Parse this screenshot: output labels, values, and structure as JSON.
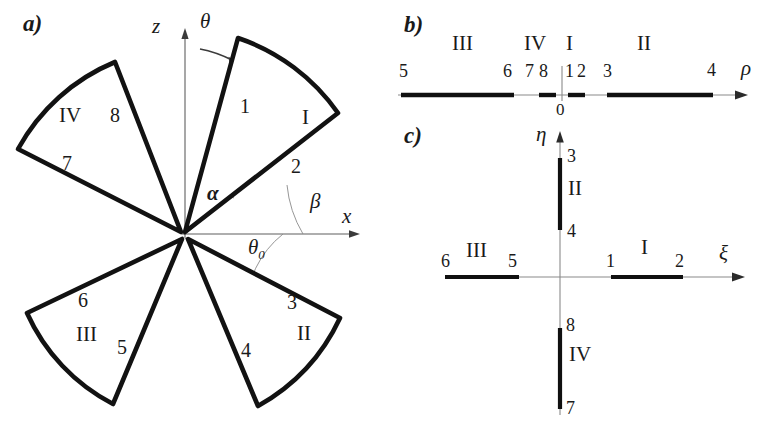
{
  "figure": {
    "kind": "diagram",
    "panels": [
      {
        "tag": "a)",
        "name": "physical-plane"
      },
      {
        "tag": "b)",
        "name": "rho-plane"
      },
      {
        "tag": "c)",
        "name": "xi-eta-plane"
      }
    ]
  },
  "panel_a": {
    "tag": "a)",
    "axes": {
      "vertical_label": "z",
      "horizontal_label": "x",
      "rotation_label": "θ",
      "rotation_icon": "curved-arrow-icon"
    },
    "angles": [
      {
        "name": "alpha",
        "symbol": "α"
      },
      {
        "name": "beta",
        "symbol": "β"
      },
      {
        "name": "theta0",
        "symbol": "θ",
        "subscript": "0"
      }
    ],
    "sectors": [
      {
        "roman": "I",
        "edges": [
          "1",
          "2"
        ]
      },
      {
        "roman": "II",
        "edges": [
          "3",
          "4"
        ]
      },
      {
        "roman": "III",
        "edges": [
          "5",
          "6"
        ]
      },
      {
        "roman": "IV",
        "edges": [
          "7",
          "8"
        ]
      }
    ]
  },
  "panel_b": {
    "tag": "b)",
    "axis_label": "ρ",
    "origin_label": "0",
    "roman_labels": [
      "III",
      "IV",
      "I",
      "II"
    ],
    "tick_labels": [
      "5",
      "6",
      "7",
      "8",
      "1",
      "2",
      "3",
      "4"
    ],
    "segments": [
      {
        "roman": "III",
        "from": "5",
        "to": "6"
      },
      {
        "roman": "IV",
        "from": "7",
        "to": "8"
      },
      {
        "roman": "I",
        "from": "1",
        "to": "2"
      },
      {
        "roman": "II",
        "from": "3",
        "to": "4"
      }
    ]
  },
  "panel_c": {
    "tag": "c)",
    "axis_label_vertical": "η",
    "axis_label_horizontal": "ξ",
    "segments": [
      {
        "roman": "I",
        "from": "1",
        "to": "2",
        "axis": "xi-positive"
      },
      {
        "roman": "II",
        "from": "3",
        "to": "4",
        "axis": "eta-positive"
      },
      {
        "roman": "III",
        "from": "6",
        "to": "5",
        "axis": "xi-negative"
      },
      {
        "roman": "IV",
        "from": "8",
        "to": "7",
        "axis": "eta-negative"
      }
    ]
  },
  "colors": {
    "ink": "#1a1a1a",
    "thin_line": "#6b6b6b",
    "background": "#ffffff"
  }
}
